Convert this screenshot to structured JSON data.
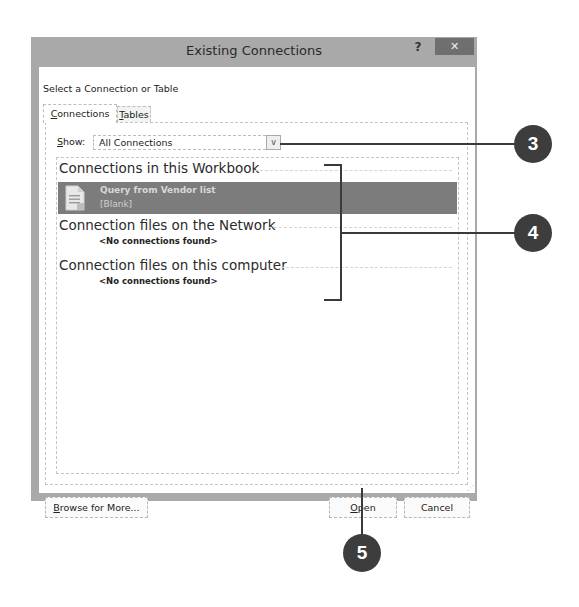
{
  "dialog": {
    "title": "Existing Connections",
    "help_label": "?",
    "close_label": "✕",
    "section_label": "Select a Connection or Table",
    "tabs": [
      {
        "label": "Connections",
        "mnemonic": "C",
        "rest": "onnections",
        "active": true
      },
      {
        "label": "Tables",
        "mnemonic": "T",
        "rest": "ables",
        "active": false
      }
    ],
    "show": {
      "label_mnemonic": "S",
      "label_rest": "how:",
      "value": "All Connections",
      "arrow": "v"
    },
    "groups": [
      {
        "header": "Connections in this Workbook",
        "items": [
          {
            "name": "Query from Vendor list",
            "description": "[Blank]",
            "icon": "document-icon",
            "selected": true
          }
        ]
      },
      {
        "header": "Connection files on the Network",
        "empty_text": "<No connections found>"
      },
      {
        "header": "Connection files on this computer",
        "empty_text": "<No connections found>"
      }
    ],
    "buttons": {
      "browse": {
        "mnemonic": "B",
        "rest": "rowse for More..."
      },
      "open": {
        "mnemonic": "O",
        "rest": "pen"
      },
      "cancel": {
        "label": "Cancel"
      }
    }
  },
  "callouts": [
    {
      "number": "3",
      "target": "show-dropdown"
    },
    {
      "number": "4",
      "target": "connection-list-groups"
    },
    {
      "number": "5",
      "target": "open-button"
    }
  ],
  "colors": {
    "titlebar": "#a9a9a9",
    "close_button": "#6f6f6f",
    "selected_row": "#7c7c7c",
    "callout": "#3d3d3d"
  }
}
